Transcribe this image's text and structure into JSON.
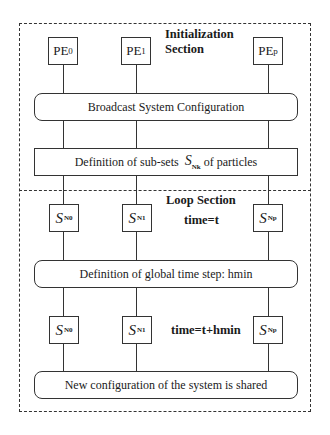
{
  "diagram": {
    "initialization_section": {
      "title_line1": "Initialization",
      "title_line2": "Section",
      "processors": [
        {
          "base": "PE",
          "sub": "0"
        },
        {
          "base": "PE",
          "sub": "1"
        },
        {
          "base": "PE",
          "sub": "p"
        }
      ],
      "broadcast_label": "Broadcast System Configuration",
      "subsets": {
        "prefix": "Definition of sub-sets",
        "symbol": "S",
        "symbol_sub": "Nk",
        "suffix": "of particles"
      }
    },
    "loop_section": {
      "title": "Loop Section",
      "row1": {
        "time_label": "time=t",
        "nodes": [
          {
            "base": "S",
            "sub": "N0"
          },
          {
            "base": "S",
            "sub": "N1"
          },
          {
            "base": "S",
            "sub": "Np"
          }
        ]
      },
      "global_step_label": "Definition of global time step: hmin",
      "row2": {
        "time_label": "time=t+hmin",
        "nodes": [
          {
            "base": "S",
            "sub": "N0"
          },
          {
            "base": "S",
            "sub": "N1"
          },
          {
            "base": "S",
            "sub": "Np"
          }
        ]
      },
      "shared_label": "New configuration of the system is shared"
    }
  }
}
